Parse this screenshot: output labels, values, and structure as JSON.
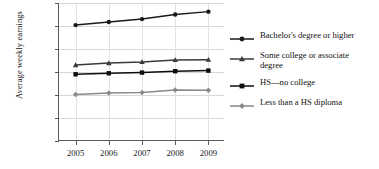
{
  "chart_data": {
    "type": "line",
    "title": "",
    "xlabel": "",
    "ylabel": "Average weekly earnings",
    "categories": [
      "2005",
      "2006",
      "2007",
      "2008",
      "2009"
    ],
    "x": [
      2005,
      2006,
      2007,
      2008,
      2009
    ],
    "ylim": [
      0,
      1200
    ],
    "ytick_labels": [
      "$0",
      "$200",
      "$400",
      "$600",
      "$800",
      "$1,000",
      "$1,200"
    ],
    "ytick_values": [
      0,
      200,
      400,
      600,
      800,
      1000,
      1200
    ],
    "grid": "horizontal-and-vertical",
    "legend_position": "right",
    "series": [
      {
        "name": "Bachelor's degree or higher",
        "marker": "circle",
        "color": "#1a1a1a",
        "values": [
          1008,
          1035,
          1060,
          1100,
          1125
        ]
      },
      {
        "name": "Some college or associate\ndegree",
        "marker": "triangle",
        "color": "#3a3a3a",
        "values": [
          660,
          678,
          688,
          705,
          707
        ]
      },
      {
        "name": "HS—no college",
        "marker": "square",
        "color": "#0d0d0d",
        "values": [
          580,
          589,
          595,
          607,
          612
        ]
      },
      {
        "name": "Less than a HS diploma",
        "marker": "diamond",
        "color": "#8a8a8a",
        "values": [
          404,
          417,
          421,
          444,
          442
        ]
      }
    ]
  },
  "axis": {
    "y_title": "Average weekly earnings",
    "y_labels": [
      "$1,200",
      "$1,000",
      "$800",
      "$600",
      "$400",
      "$200",
      "$0"
    ],
    "x_labels": [
      "2005",
      "2006",
      "2007",
      "2008",
      "2009"
    ]
  },
  "legend": {
    "items": [
      {
        "label": "Bachelor's degree or higher",
        "marker": "circle-marker-icon",
        "color": "#1a1a1a"
      },
      {
        "label": "Some college or associate\ndegree",
        "marker": "triangle-marker-icon",
        "color": "#3a3a3a"
      },
      {
        "label": "HS—no college",
        "marker": "square-marker-icon",
        "color": "#0d0d0d"
      },
      {
        "label": "Less than a HS diploma",
        "marker": "diamond-marker-icon",
        "color": "#8a8a8a"
      }
    ]
  }
}
